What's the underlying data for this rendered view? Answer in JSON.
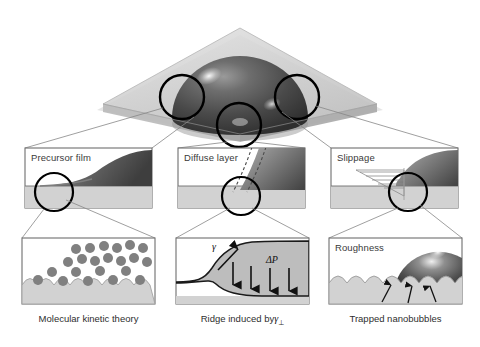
{
  "figure": {
    "type": "scientific-schematic",
    "background": "#ffffff",
    "colors": {
      "substrate_band": "#d2d2d2",
      "substrate_band_dark": "#c4c4c4",
      "panel_border": "#6e6e6e",
      "connector": "#7a7a7a",
      "circle_marker": "#000000",
      "droplet_dark": "#3c3c3c",
      "droplet_mid": "#6f6f6f",
      "droplet_light": "#b8b8b8",
      "molecule_fill": "#808080",
      "plate_glass": "#c9c9c9",
      "liquid_fill": "#bdbdbd",
      "text": "#2e2e2e",
      "arrow": "#111111"
    }
  },
  "overview": {
    "name": "droplet-on-plate",
    "description": "Dark gray hemispherical droplet resting on a translucent square plate shown in perspective",
    "markers": [
      {
        "id": "left",
        "label": "precursor-film-region",
        "cx": 182,
        "cy": 97,
        "r": 22
      },
      {
        "id": "center",
        "label": "diffuse-layer-region",
        "cx": 239,
        "cy": 125,
        "r": 22
      },
      {
        "id": "right",
        "label": "slippage-region",
        "cx": 297,
        "cy": 97,
        "r": 22
      }
    ]
  },
  "columns": [
    {
      "id": "left",
      "upper": {
        "label": "Precursor film",
        "detail": "Droplet edge with a thin precursor film spreading ahead of the contact line",
        "marker": {
          "cx": 54,
          "cy": 192,
          "r": 19
        }
      },
      "lower": {
        "label": "",
        "detail": "Discrete liquid molecules hopping across a corrugated solid surface",
        "molecule_count": 22
      },
      "caption": "Molecular kinetic theory"
    },
    {
      "id": "center",
      "upper": {
        "label": "Diffuse layer",
        "detail": "Droplet edge bounded by dashed lines marking a diffuse interfacial layer",
        "marker": {
          "cx": 241,
          "cy": 196,
          "r": 19
        }
      },
      "lower": {
        "label": "",
        "detail": "Wetting ridge raised at the contact line by the vertical component of surface tension",
        "annotations": [
          {
            "symbol": "γ",
            "name": "surface-tension-gamma"
          },
          {
            "symbol": "ΔP",
            "name": "laplace-pressure-delta-p"
          }
        ],
        "pressure_arrow_count": 4
      },
      "caption": "Ridge induced by γ⊥",
      "caption_main": "Ridge induced by",
      "caption_symbol": "γ",
      "caption_subscript": "⊥"
    },
    {
      "id": "right",
      "upper": {
        "label": "Slippage",
        "detail": "Triangular velocity profile indicating slip of liquid over the solid near the contact line",
        "marker": {
          "cx": 408,
          "cy": 192,
          "r": 19
        },
        "velocity_lines": 5
      },
      "lower": {
        "label": "Roughness",
        "detail": "Droplet sitting on a rough surface with gas pockets trapped in the grooves",
        "arrow_count": 3
      },
      "caption": "Trapped nanobubbles"
    }
  ]
}
